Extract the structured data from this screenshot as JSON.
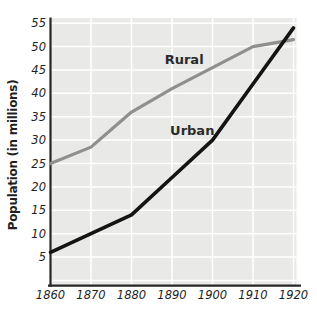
{
  "figure": {
    "background": "#ffffff",
    "plot_bg": "#e9e9e7",
    "grid_color": "#ffffff",
    "axis_color": "#262626",
    "text_color": "#1f1f1f"
  },
  "chart_data": {
    "type": "line",
    "title": "",
    "xlabel": "",
    "ylabel": "Population (in millions)",
    "x": [
      1860,
      1870,
      1880,
      1890,
      1900,
      1910,
      1920
    ],
    "x_tick_labels": [
      "1860",
      "1870",
      "1880",
      "1890",
      "1900",
      "1910",
      "1920"
    ],
    "y_ticks": [
      5,
      10,
      15,
      20,
      25,
      30,
      35,
      40,
      45,
      50,
      55
    ],
    "xlim": [
      1860,
      1920.7
    ],
    "ylim": [
      -1,
      56
    ],
    "grid": true,
    "legend_position": "inline-labels",
    "series": [
      {
        "name": "Rural",
        "color": "#8f8f8d",
        "width": 3.2,
        "values": [
          25,
          28.5,
          36,
          41,
          45.5,
          50,
          51.5
        ],
        "label_at": {
          "x": 1893,
          "y": 46.3
        }
      },
      {
        "name": "Urban",
        "color": "#141414",
        "width": 3.6,
        "values": [
          6,
          10,
          14,
          22,
          30,
          42,
          54
        ],
        "label_at": {
          "x": 1895,
          "y": 31.1
        }
      }
    ]
  }
}
